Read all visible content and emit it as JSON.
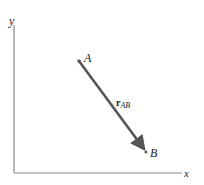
{
  "diagram": {
    "axes": {
      "x_label": "x",
      "y_label": "y",
      "origin": [
        14,
        173
      ],
      "x_end": [
        182,
        173
      ],
      "y_end": [
        14,
        25
      ],
      "color": "#8a8a8a"
    },
    "points": [
      {
        "id": "A",
        "label": "A",
        "pos": [
          79,
          61
        ]
      },
      {
        "id": "B",
        "label": "B",
        "pos": [
          146,
          152
        ]
      }
    ],
    "vector": {
      "from": "A",
      "to": "B",
      "label_main": "r",
      "label_sub": "AB",
      "color": "#555555"
    }
  }
}
